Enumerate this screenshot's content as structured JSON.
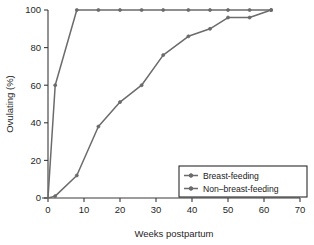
{
  "chart_data": {
    "type": "line",
    "title": "",
    "xlabel": "Weeks postpartum",
    "ylabel": "Ovulating (%)",
    "xlim": [
      -3,
      70
    ],
    "ylim": [
      0,
      100
    ],
    "xticks": [
      0,
      10,
      20,
      30,
      40,
      50,
      60,
      70
    ],
    "xtick_labels": [
      "0",
      "10",
      "20",
      "30",
      "40",
      "50",
      "60",
      "70"
    ],
    "yticks": [
      0,
      20,
      40,
      60,
      80,
      100
    ],
    "ytick_labels": [
      "0",
      "20",
      "40",
      "60",
      "80",
      "100"
    ],
    "grid": false,
    "legend_position": "lower right",
    "line_color": "#6b6b6b",
    "axis_color": "#3a3a3a",
    "series": [
      {
        "name": "Breast-feeding",
        "marker": "circle",
        "x": [
          0,
          2,
          8,
          14,
          20,
          26,
          32,
          39,
          45,
          50,
          56,
          62
        ],
        "y": [
          0,
          1,
          12,
          38,
          51,
          60,
          76,
          86,
          90,
          96,
          96,
          100
        ]
      },
      {
        "name": "Non–breast-feeding",
        "marker": "circle",
        "x": [
          0,
          2,
          8,
          14,
          20,
          26,
          32,
          39,
          45,
          50,
          56,
          62
        ],
        "y": [
          0,
          60,
          100,
          100,
          100,
          100,
          100,
          100,
          100,
          100,
          100,
          100
        ]
      }
    ]
  },
  "legend": {
    "entries": [
      {
        "label": "Breast-feeding"
      },
      {
        "label": "Non–breast-feeding"
      }
    ]
  },
  "axes": {
    "x_title": "Weeks postpartum",
    "y_title": "Ovulating (%)"
  }
}
